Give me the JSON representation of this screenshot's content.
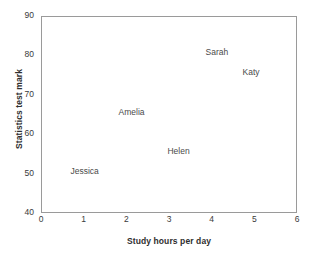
{
  "chart_data": {
    "type": "scatter",
    "title": "",
    "xlabel": "Study hours per day",
    "ylabel": "Statistics test mark",
    "xlim": [
      0,
      6
    ],
    "ylim": [
      40,
      90
    ],
    "xticks": [
      "0",
      "1",
      "2",
      "3",
      "4",
      "5",
      "6"
    ],
    "yticks": [
      "40",
      "50",
      "60",
      "70",
      "80",
      "90"
    ],
    "grid": false,
    "legend": "none",
    "markers": "none",
    "point_label_position": "at data point",
    "points": [
      {
        "label": "Jessica",
        "x": 1.0,
        "y": 51
      },
      {
        "label": "Amelia",
        "x": 2.1,
        "y": 66
      },
      {
        "label": "Helen",
        "x": 3.2,
        "y": 56
      },
      {
        "label": "Sarah",
        "x": 4.1,
        "y": 81
      },
      {
        "label": "Katy",
        "x": 4.9,
        "y": 76
      }
    ]
  },
  "colors": {
    "frame": "#9a9a9a",
    "text": "#3a3a3a",
    "axis_label": "#2e2e2e",
    "point_label": "#4a4a4a",
    "background": "#ffffff"
  }
}
